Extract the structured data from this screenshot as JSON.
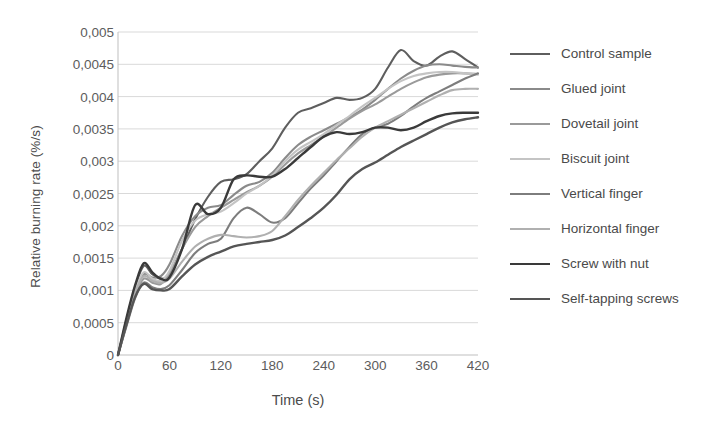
{
  "chart_data": {
    "type": "line",
    "title": "",
    "xlabel": "Time (s)",
    "ylabel": "Relative burning rate (%/s)",
    "xlim": [
      0,
      420
    ],
    "ylim": [
      0,
      0.005
    ],
    "xticks": [
      "0",
      "60",
      "120",
      "180",
      "240",
      "300",
      "360",
      "420"
    ],
    "xtick_values": [
      0,
      60,
      120,
      180,
      240,
      300,
      360,
      420
    ],
    "yticks": [
      "0",
      "0,0005",
      "0,001",
      "0,0015",
      "0,002",
      "0,0025",
      "0,003",
      "0,0035",
      "0,004",
      "0,0045",
      "0,005"
    ],
    "ytick_values": [
      0,
      0.0005,
      0.001,
      0.0015,
      0.002,
      0.0025,
      0.003,
      0.0035,
      0.004,
      0.0045,
      0.005
    ],
    "grid": "horizontal",
    "legend_position": "right",
    "x": [
      0,
      10,
      20,
      30,
      40,
      50,
      60,
      75,
      90,
      105,
      120,
      135,
      150,
      165,
      180,
      195,
      210,
      225,
      240,
      255,
      270,
      285,
      300,
      315,
      330,
      345,
      360,
      375,
      390,
      405,
      420
    ],
    "series": [
      {
        "name": "Control sample",
        "color": "#5e5e5e",
        "width": 2.1,
        "values": [
          0,
          0.00055,
          0.00105,
          0.00138,
          0.00125,
          0.00118,
          0.00125,
          0.00165,
          0.0021,
          0.00245,
          0.00268,
          0.00272,
          0.0028,
          0.003,
          0.0032,
          0.00352,
          0.00375,
          0.00382,
          0.0039,
          0.00398,
          0.00395,
          0.00398,
          0.00412,
          0.00445,
          0.00472,
          0.00455,
          0.00448,
          0.00462,
          0.0047,
          0.00458,
          0.00445
        ]
      },
      {
        "name": "Glued joint",
        "color": "#8a8a8a",
        "width": 2.1,
        "values": [
          0,
          0.0005,
          0.00098,
          0.00125,
          0.0012,
          0.00122,
          0.0014,
          0.00185,
          0.00215,
          0.00228,
          0.00232,
          0.00248,
          0.00262,
          0.00268,
          0.00282,
          0.00305,
          0.00325,
          0.00338,
          0.00348,
          0.00358,
          0.00368,
          0.0038,
          0.00395,
          0.00412,
          0.00428,
          0.0044,
          0.00448,
          0.0045,
          0.00448,
          0.00446,
          0.00445
        ]
      },
      {
        "name": "Dovetail joint",
        "color": "#9a9a9a",
        "width": 2.1,
        "values": [
          0,
          0.00048,
          0.00092,
          0.00118,
          0.00112,
          0.0011,
          0.00125,
          0.00165,
          0.00198,
          0.00215,
          0.00228,
          0.0024,
          0.00252,
          0.00262,
          0.00276,
          0.00295,
          0.00312,
          0.00325,
          0.00338,
          0.00352,
          0.00366,
          0.00378,
          0.00388,
          0.004,
          0.00412,
          0.00422,
          0.0043,
          0.00434,
          0.00436,
          0.00436,
          0.00435
        ]
      },
      {
        "name": "Biscuit joint",
        "color": "#c4c4c4",
        "width": 2.1,
        "values": [
          0,
          0.00052,
          0.001,
          0.00128,
          0.00118,
          0.00115,
          0.0013,
          0.00178,
          0.00208,
          0.00218,
          0.00222,
          0.00235,
          0.0025,
          0.00262,
          0.00278,
          0.003,
          0.00318,
          0.0033,
          0.00342,
          0.00356,
          0.0037,
          0.00385,
          0.00398,
          0.00412,
          0.00424,
          0.00432,
          0.00436,
          0.00438,
          0.00438,
          0.00436,
          0.00434
        ]
      },
      {
        "name": "Vertical finger",
        "color": "#7d7d7d",
        "width": 2.1,
        "values": [
          0,
          0.00045,
          0.00088,
          0.00112,
          0.00105,
          0.00102,
          0.00108,
          0.00132,
          0.00158,
          0.00172,
          0.0018,
          0.00212,
          0.00228,
          0.00218,
          0.00205,
          0.00212,
          0.00235,
          0.00258,
          0.00278,
          0.003,
          0.00322,
          0.00342,
          0.00352,
          0.00358,
          0.0037,
          0.00385,
          0.00398,
          0.00408,
          0.00418,
          0.00428,
          0.00436
        ]
      },
      {
        "name": "Horizontal finger",
        "color": "#b0b0b0",
        "width": 2.1,
        "values": [
          0,
          0.0005,
          0.00096,
          0.00122,
          0.00115,
          0.00112,
          0.00118,
          0.00145,
          0.00168,
          0.0018,
          0.00186,
          0.00184,
          0.00182,
          0.00184,
          0.00192,
          0.00215,
          0.0024,
          0.00262,
          0.00282,
          0.00302,
          0.0032,
          0.00338,
          0.00352,
          0.00362,
          0.00372,
          0.00382,
          0.00392,
          0.00402,
          0.0041,
          0.00412,
          0.00412
        ]
      },
      {
        "name": "Screw with nut",
        "color": "#3a3a3a",
        "width": 2.4,
        "values": [
          0,
          0.00058,
          0.00108,
          0.00142,
          0.00128,
          0.00118,
          0.0012,
          0.00165,
          0.00232,
          0.00218,
          0.00228,
          0.00272,
          0.00278,
          0.00276,
          0.00276,
          0.00288,
          0.00305,
          0.00322,
          0.00338,
          0.00345,
          0.00342,
          0.00345,
          0.00352,
          0.00352,
          0.00348,
          0.00352,
          0.00362,
          0.0037,
          0.00374,
          0.00375,
          0.00375
        ]
      },
      {
        "name": "Self-tapping screws",
        "color": "#555555",
        "width": 2.4,
        "values": [
          0,
          0.00048,
          0.0009,
          0.0011,
          0.00102,
          0.001,
          0.00102,
          0.00122,
          0.0014,
          0.00152,
          0.0016,
          0.00168,
          0.00172,
          0.00175,
          0.00178,
          0.00185,
          0.00198,
          0.00212,
          0.00228,
          0.00248,
          0.00272,
          0.00288,
          0.00298,
          0.0031,
          0.00322,
          0.00332,
          0.00342,
          0.00352,
          0.0036,
          0.00365,
          0.00368
        ]
      }
    ]
  },
  "legend": {
    "items": [
      {
        "label": "Control sample"
      },
      {
        "label": "Glued joint"
      },
      {
        "label": "Dovetail joint"
      },
      {
        "label": "Biscuit joint"
      },
      {
        "label": "Vertical finger"
      },
      {
        "label": "Horizontal finger"
      },
      {
        "label": "Screw with nut"
      },
      {
        "label": "Self-tapping screws"
      }
    ]
  },
  "colors": {
    "grid": "#d9d9d9",
    "axis": "#bfbfbf",
    "text": "#5c5c5c",
    "background": "#ffffff"
  }
}
